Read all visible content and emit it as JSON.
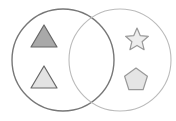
{
  "diagram": {
    "type": "venn",
    "sets": [
      {
        "name": "left-set",
        "cx": 63,
        "cy": 60,
        "r": 51,
        "stroke": "#777777",
        "stroke_width": 1.4
      },
      {
        "name": "right-set",
        "cx": 120,
        "cy": 60,
        "r": 51,
        "stroke": "#bbbbbb",
        "stroke_width": 1.1
      }
    ],
    "shapes": [
      {
        "kind": "triangle",
        "set": "left",
        "points": "44,25 31,47 57,47",
        "fill": "#a9a9a9",
        "stroke": "#666666"
      },
      {
        "kind": "triangle",
        "set": "left",
        "points": "44,66 31,88 57,88",
        "fill": "#e3e3e3",
        "stroke": "#666666"
      },
      {
        "kind": "star",
        "set": "right",
        "cx": 137,
        "cy": 40,
        "r": 12,
        "fill": "#eeeeee",
        "stroke": "#999999"
      },
      {
        "kind": "pentagon",
        "set": "right",
        "cx": 136,
        "cy": 80,
        "r": 12,
        "fill": "#e5e5e5",
        "stroke": "#999999"
      }
    ]
  }
}
